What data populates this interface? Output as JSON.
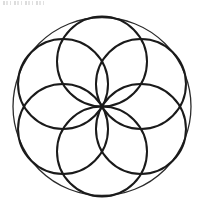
{
  "page": {
    "title": "Seed of Life Rosette",
    "width": 201,
    "height": 202,
    "background_color": "#ffffff"
  },
  "figure": {
    "name": "seed-of-life",
    "stroke_color": "#1a1a1a",
    "fill": "none",
    "center": {
      "x": 102,
      "y": 106.5
    },
    "outer_circle": {
      "label": "outer-circle",
      "cx": 102,
      "cy": 106.5,
      "r": 89,
      "stroke_width": 1.3,
      "stroke_color": "#2b2b2b"
    },
    "inner_circles": [
      {
        "label": "inner-circle-top",
        "angle_deg": 270,
        "cx": 102,
        "cy": 61.5,
        "r": 45,
        "stroke_width": 2.0
      },
      {
        "label": "inner-circle-upper-right",
        "angle_deg": 330,
        "cx": 140.97,
        "cy": 84.0,
        "r": 45,
        "stroke_width": 2.0
      },
      {
        "label": "inner-circle-lower-right",
        "angle_deg": 30,
        "cx": 140.97,
        "cy": 129.0,
        "r": 45,
        "stroke_width": 2.0
      },
      {
        "label": "inner-circle-bottom",
        "angle_deg": 90,
        "cx": 102,
        "cy": 151.5,
        "r": 45,
        "stroke_width": 2.0
      },
      {
        "label": "inner-circle-lower-left",
        "angle_deg": 150,
        "cx": 63.03,
        "cy": 129.0,
        "r": 45,
        "stroke_width": 2.0
      },
      {
        "label": "inner-circle-upper-left",
        "angle_deg": 210,
        "cx": 63.03,
        "cy": 84.0,
        "r": 45,
        "stroke_width": 2.0
      }
    ],
    "petal_count": 6,
    "artifact": {
      "label": "top-scan-artifact",
      "description": "faint illegible gray pixel smudge along the top-left edge",
      "color": "#9a9a9a"
    }
  }
}
